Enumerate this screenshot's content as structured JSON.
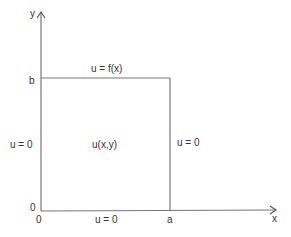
{
  "axes": {
    "x_label": "x",
    "y_label": "y"
  },
  "ticks": {
    "b": "b",
    "a": "a",
    "origin_x": "0",
    "origin_y": "0"
  },
  "boundaries": {
    "top": "u = f(x)",
    "left": "u = 0",
    "right": "u = 0",
    "bottom": "u = 0"
  },
  "interior": "u(x,y)",
  "colors": {
    "line": "#777777",
    "text": "#333333"
  }
}
